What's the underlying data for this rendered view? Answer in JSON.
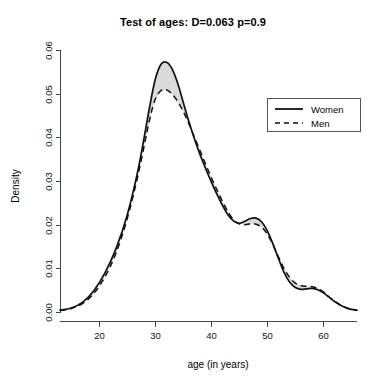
{
  "chart_data": {
    "type": "line",
    "title": "Test of ages: D=0.063 p=0.9",
    "xlabel": "age (in years)",
    "ylabel": "Density",
    "xlim": [
      13,
      66
    ],
    "ylim": [
      0,
      0.062
    ],
    "xticks": [
      20,
      30,
      40,
      50,
      60
    ],
    "xtick_labels": [
      "20",
      "30",
      "40",
      "50",
      "60"
    ],
    "yticks": [
      0.0,
      0.01,
      0.02,
      0.03,
      0.04,
      0.05,
      0.06
    ],
    "ytick_labels": [
      "0.00",
      "0.01",
      "0.02",
      "0.03",
      "0.04",
      "0.05",
      "0.06"
    ],
    "grid": false,
    "legend_position": "top-right",
    "shaded_band": true,
    "shaded_band_color": "#d4d4d4",
    "x": [
      13,
      15,
      17,
      19,
      21,
      23,
      25,
      27,
      29,
      30,
      31,
      32,
      33,
      34,
      35,
      36,
      37,
      38,
      39,
      40,
      41,
      42,
      43,
      44,
      45,
      46,
      47,
      48,
      49,
      50,
      51,
      52,
      53,
      54,
      55,
      56,
      57,
      58,
      59,
      60,
      61,
      62,
      63,
      64,
      65,
      66
    ],
    "series": [
      {
        "name": "Women",
        "style": "solid",
        "color": "#111111",
        "values": [
          0.0004,
          0.0009,
          0.0022,
          0.0048,
          0.0089,
          0.0145,
          0.0222,
          0.033,
          0.047,
          0.0533,
          0.0567,
          0.0572,
          0.0557,
          0.0524,
          0.048,
          0.0436,
          0.0396,
          0.036,
          0.0328,
          0.0298,
          0.027,
          0.0244,
          0.0222,
          0.0208,
          0.0203,
          0.0208,
          0.0214,
          0.0215,
          0.0206,
          0.0186,
          0.0156,
          0.0122,
          0.009,
          0.0068,
          0.0056,
          0.0052,
          0.0053,
          0.0054,
          0.0051,
          0.0044,
          0.0034,
          0.0024,
          0.0016,
          0.001,
          0.0006,
          0.0004
        ]
      },
      {
        "name": "Men",
        "style": "dashed",
        "color": "#111111",
        "values": [
          0.0003,
          0.0008,
          0.0019,
          0.0042,
          0.008,
          0.0135,
          0.0214,
          0.0318,
          0.0441,
          0.0487,
          0.0507,
          0.0509,
          0.0499,
          0.0482,
          0.0459,
          0.0431,
          0.04,
          0.0369,
          0.0338,
          0.0308,
          0.028,
          0.0253,
          0.0229,
          0.0211,
          0.0202,
          0.02,
          0.0202,
          0.0201,
          0.0194,
          0.0178,
          0.0154,
          0.0126,
          0.0099,
          0.0079,
          0.0066,
          0.006,
          0.0059,
          0.0058,
          0.0054,
          0.0046,
          0.0035,
          0.0025,
          0.0016,
          0.001,
          0.0006,
          0.0004
        ]
      }
    ],
    "annotations": {
      "women_peak_age": 32,
      "women_peak_density": 0.0572,
      "men_peak_age": 32,
      "men_peak_density": 0.0509,
      "secondary_shoulder_age": 48,
      "secondary_shoulder_density": 0.0215
    }
  },
  "legend": {
    "entries": [
      {
        "label": "Women",
        "style": "solid"
      },
      {
        "label": "Men",
        "style": "dashed"
      }
    ]
  }
}
